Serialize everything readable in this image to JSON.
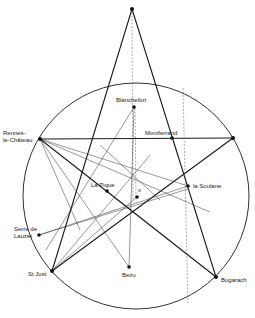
{
  "diagram": {
    "type": "geometric-map",
    "circle": {
      "cx": 136,
      "cy": 196,
      "r": 113
    },
    "points": {
      "apex": {
        "x": 132,
        "y": 9,
        "label": ""
      },
      "rennes": {
        "x": 40,
        "y": 139,
        "label_lines": [
          "Rennes-",
          "le-Château"
        ]
      },
      "right_point": {
        "x": 233,
        "y": 138,
        "label": ""
      },
      "blanchefort": {
        "x": 134,
        "y": 107,
        "label": "Blanchefort"
      },
      "montferrand": {
        "x": 172,
        "y": 138,
        "label": "Montferrand"
      },
      "la_pique": {
        "x": 107,
        "y": 191,
        "label": "La Pique"
      },
      "x_point": {
        "x": 137,
        "y": 197,
        "label": "x"
      },
      "la_soulane": {
        "x": 188,
        "y": 186,
        "label": "la Soulane"
      },
      "serre_de_lauzet": {
        "x": 39,
        "y": 235,
        "label_lines": [
          "Serre de",
          "Lauzet"
        ]
      },
      "st_just": {
        "x": 52,
        "y": 271,
        "label": "St Just"
      },
      "bezu": {
        "x": 129,
        "y": 267,
        "label": "Bezu"
      },
      "bugarach": {
        "x": 216,
        "y": 277,
        "label": "Bugarach"
      }
    },
    "labels": {
      "rennes_1": "Rennes-",
      "rennes_2": "le-Château",
      "blanchefort": "Blanchefort",
      "montferrand": "Montferrand",
      "la_pique": "La Pique",
      "x_point": "x",
      "la_soulane": "la Soulane",
      "serre_1": "Serre de",
      "serre_2": "Lauzet",
      "st_just": "St Just",
      "bezu": "Bezu",
      "bugarach": "Bugarach"
    }
  }
}
